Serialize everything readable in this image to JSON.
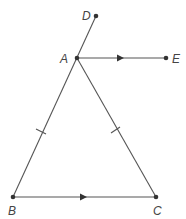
{
  "diagram": {
    "type": "geometry",
    "points": {
      "D": {
        "label": "D",
        "x": 96,
        "y": 16
      },
      "A": {
        "label": "A",
        "x": 77,
        "y": 58
      },
      "E": {
        "label": "E",
        "x": 166,
        "y": 58
      },
      "B": {
        "label": "B",
        "x": 13,
        "y": 197
      },
      "C": {
        "label": "C",
        "x": 156,
        "y": 197
      }
    },
    "segments": [
      {
        "from": "B",
        "to": "D",
        "note": "BA extended through A to D"
      },
      {
        "from": "A",
        "to": "C"
      },
      {
        "from": "B",
        "to": "C",
        "marking": "parallel-arrow"
      },
      {
        "from": "A",
        "to": "E",
        "marking": "parallel-arrow"
      }
    ],
    "equal_marks": [
      {
        "segment": "AB",
        "ticks": 1
      },
      {
        "segment": "AC",
        "ticks": 1
      }
    ],
    "parallel": [
      [
        "AE",
        "BC"
      ]
    ],
    "colors": {
      "line": "#555555",
      "point": "#333333",
      "label": "#444444"
    }
  }
}
